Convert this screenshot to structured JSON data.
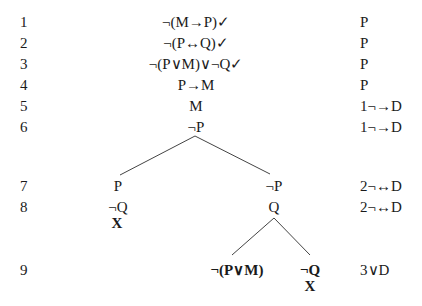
{
  "tree": {
    "line_numbers": [
      "1",
      "2",
      "3",
      "4",
      "5",
      "6",
      "7",
      "8",
      "9"
    ],
    "trunk": [
      {
        "line": "1",
        "formula": "¬(M→P)✓",
        "justification": "P"
      },
      {
        "line": "2",
        "formula": "¬(P↔Q)✓",
        "justification": "P"
      },
      {
        "line": "3",
        "formula": "¬(P∨M)∨¬Q✓",
        "justification": "P"
      },
      {
        "line": "4",
        "formula": "P→M",
        "justification": "P"
      },
      {
        "line": "5",
        "formula": "M",
        "justification": "1¬→D"
      },
      {
        "line": "6",
        "formula": "¬P",
        "justification": "1¬→D"
      }
    ],
    "branch_left": {
      "line7": "P",
      "line8": "¬Q",
      "close": "X"
    },
    "branch_right": {
      "line7": "¬P",
      "line8": "Q"
    },
    "sub_left": {
      "line9": "¬(P∨M)"
    },
    "sub_right": {
      "line9": "¬Q",
      "close": "X"
    },
    "justifications": {
      "line7": "2¬↔D",
      "line8": "2¬↔D",
      "line9": "3∨D"
    }
  }
}
